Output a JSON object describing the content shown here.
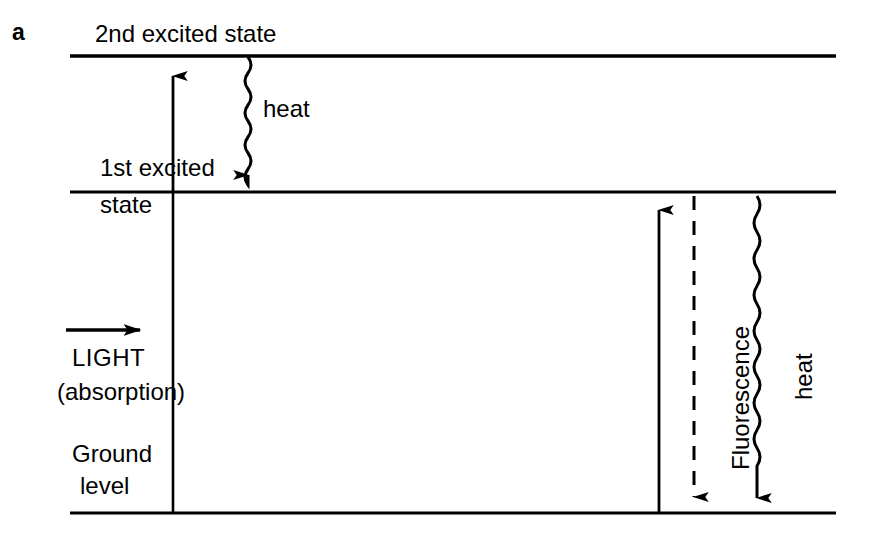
{
  "figure": {
    "panel_letter": "a",
    "type": "energy-level-diagram",
    "background_color": "#ffffff",
    "line_color": "#000000"
  },
  "levels": [
    {
      "id": "second-excited",
      "label": "2nd excited state",
      "y": 56,
      "x_start": 70,
      "x_end": 836
    },
    {
      "id": "first-excited",
      "label_line1": "1st excited",
      "label_line2": "state",
      "y": 192,
      "x_start": 70,
      "x_end": 836
    },
    {
      "id": "ground",
      "label_line1": "Ground",
      "label_line2": "level",
      "y": 513,
      "x_start": 70,
      "x_end": 836
    }
  ],
  "transitions": [
    {
      "id": "excitation-up",
      "label": "",
      "style": "solid-arrow-up",
      "x": 173,
      "y_from": 192,
      "y_to": 60
    },
    {
      "id": "heat-top",
      "label": "heat",
      "style": "wavy-arrow-down",
      "x": 248,
      "y_from": 57,
      "y_to": 190
    },
    {
      "id": "light-absorption",
      "label_line1": "LIGHT",
      "label_line2": "(absorption)",
      "style": "solid-arrow-right",
      "y": 330,
      "x_from": 66,
      "x_to": 157
    },
    {
      "id": "absorption-up-right",
      "label": "",
      "style": "solid-arrow-up",
      "x": 659,
      "y_from": 513,
      "y_to": 196
    },
    {
      "id": "fluorescence",
      "label": "Fluorescence",
      "style": "dashed-arrow-down",
      "x": 694,
      "y_from": 196,
      "y_to": 513
    },
    {
      "id": "heat-right",
      "label": "heat",
      "style": "wavy-arrow-down",
      "x": 757,
      "y_from": 196,
      "y_to": 513
    }
  ],
  "divider": {
    "id": "left-vertical-divider",
    "x": 173,
    "y_top": 192,
    "y_bottom": 513
  }
}
